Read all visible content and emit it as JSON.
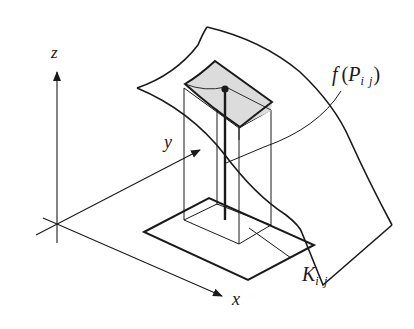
{
  "diagram": {
    "type": "3d-riemann-sum-illustration",
    "labels": {
      "z_axis": "z",
      "y_axis": "y",
      "x_axis": "x",
      "f_label_func": "f",
      "f_label_open": "(",
      "f_label_var": "P",
      "f_label_sub": "i j",
      "f_label_close": ")",
      "k_label_var": "K",
      "k_label_sub": "i j"
    },
    "colors": {
      "ink": "#1a1a1a",
      "patch_fill": "#dcdcdc",
      "background": "#ffffff"
    }
  }
}
